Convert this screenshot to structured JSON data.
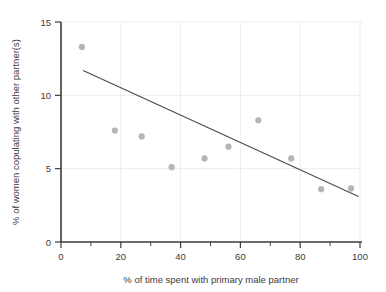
{
  "chart_data": {
    "type": "scatter",
    "title": "",
    "xlabel": "% of time spent with primary male partner",
    "ylabel": "% of women copulating with other partner(s)",
    "xlim": [
      0,
      100
    ],
    "ylim": [
      0,
      15
    ],
    "xticks": [
      0,
      20,
      40,
      60,
      80,
      100
    ],
    "xtick_labels": [
      "0",
      "20",
      "40",
      "60",
      "80",
      "100"
    ],
    "xminor_ticks": [
      10,
      30,
      50,
      70,
      90
    ],
    "yticks": [
      0,
      5,
      10,
      15
    ],
    "ytick_labels": [
      "0",
      "5",
      "10",
      "15"
    ],
    "grid": true,
    "legend": false,
    "point_color": "#b5b5b5",
    "line_color": "#4a4a4a",
    "axis_color": "#3b3b3b",
    "grid_color": "#ededed",
    "points": [
      {
        "x": 7,
        "y": 13.3
      },
      {
        "x": 18,
        "y": 7.6
      },
      {
        "x": 27,
        "y": 7.2
      },
      {
        "x": 37,
        "y": 5.1
      },
      {
        "x": 48,
        "y": 5.7
      },
      {
        "x": 56,
        "y": 6.5
      },
      {
        "x": 66,
        "y": 8.3
      },
      {
        "x": 77,
        "y": 5.7
      },
      {
        "x": 87,
        "y": 3.6
      },
      {
        "x": 97,
        "y": 3.65
      }
    ],
    "trend_line": {
      "x1": 7.4,
      "y1": 11.7,
      "x2": 99.5,
      "y2": 3.1
    }
  }
}
